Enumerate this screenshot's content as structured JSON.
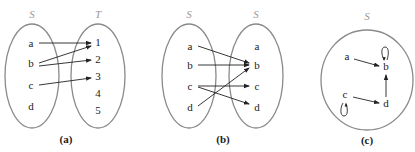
{
  "panels": [
    {
      "caption": "(a)",
      "domain_label": "S",
      "codomain_label": "T",
      "domain_elements": [
        "a",
        "b",
        "c",
        "d"
      ],
      "codomain_elements": [
        "1",
        "2",
        "3",
        "4",
        "5"
      ],
      "relation": [
        [
          "a",
          "1"
        ],
        [
          "b",
          "1"
        ],
        [
          "b",
          "2"
        ],
        [
          "c",
          "3"
        ]
      ]
    },
    {
      "caption": "(b)",
      "domain_label": "S",
      "codomain_label": "S",
      "domain_elements": [
        "a",
        "b",
        "c",
        "d"
      ],
      "codomain_elements": [
        "a",
        "b",
        "c",
        "d"
      ],
      "relation": [
        [
          "a",
          "b"
        ],
        [
          "b",
          "b"
        ],
        [
          "c",
          "c"
        ],
        [
          "c",
          "d"
        ],
        [
          "d",
          "b"
        ]
      ]
    },
    {
      "caption": "(c)",
      "set_label": "S",
      "elements": [
        "a",
        "b",
        "c",
        "d"
      ],
      "relation": [
        [
          "a",
          "b"
        ],
        [
          "b",
          "b"
        ],
        [
          "c",
          "c"
        ],
        [
          "c",
          "d"
        ],
        [
          "d",
          "b"
        ]
      ]
    }
  ]
}
